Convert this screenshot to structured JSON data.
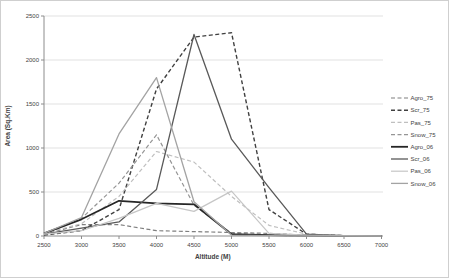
{
  "figure": {
    "kind": "excel-style-line-chart",
    "background": "#ffffff",
    "border_color": "#cfcfcf"
  },
  "chart_data": {
    "type": "line",
    "title": "",
    "xlabel": "Altitude (M)",
    "ylabel": "Area (Sq.Km)",
    "x": [
      2500,
      3000,
      3500,
      4000,
      4500,
      5000,
      5500,
      6000,
      6500,
      7000
    ],
    "xlim": [
      2500,
      7000
    ],
    "ylim": [
      0,
      2500
    ],
    "yticks": [
      0,
      500,
      1000,
      1500,
      2000,
      2500
    ],
    "grid": "horizontal",
    "grid_color": "#d9d9d9",
    "axis_color": "#8c8c8c",
    "text_color": "#3f3f3f",
    "legend_position": "right",
    "series": [
      {
        "name": "Agro_75",
        "style": "dashed",
        "color": "#7f7f7f",
        "width": 1.2,
        "values": [
          20,
          130,
          130,
          60,
          50,
          40,
          30,
          10,
          5,
          0
        ]
      },
      {
        "name": "Scr_75",
        "style": "dashed",
        "color": "#404040",
        "width": 1.4,
        "values": [
          10,
          60,
          300,
          1670,
          2260,
          2310,
          300,
          20,
          5,
          0
        ]
      },
      {
        "name": "Pas_75",
        "style": "dashed",
        "color": "#bfbfbf",
        "width": 1.2,
        "values": [
          30,
          140,
          450,
          960,
          840,
          450,
          120,
          20,
          5,
          0
        ]
      },
      {
        "name": "Snow_75",
        "style": "dashed",
        "color": "#959595",
        "width": 1.2,
        "values": [
          20,
          200,
          600,
          1150,
          350,
          30,
          10,
          0,
          0,
          0
        ]
      },
      {
        "name": "Agro_06",
        "style": "solid",
        "color": "#262626",
        "width": 1.8,
        "values": [
          30,
          190,
          400,
          370,
          360,
          20,
          10,
          5,
          0,
          0
        ]
      },
      {
        "name": "Scr_06",
        "style": "solid",
        "color": "#595959",
        "width": 1.3,
        "values": [
          20,
          90,
          160,
          530,
          2290,
          1100,
          550,
          20,
          5,
          0
        ]
      },
      {
        "name": "Pas_06",
        "style": "solid",
        "color": "#c6c6c6",
        "width": 1.2,
        "values": [
          20,
          60,
          200,
          370,
          280,
          510,
          30,
          10,
          5,
          0
        ]
      },
      {
        "name": "Snow_06",
        "style": "solid",
        "color": "#a3a3a3",
        "width": 1.3,
        "values": [
          30,
          210,
          1160,
          1800,
          390,
          10,
          5,
          0,
          0,
          0
        ]
      }
    ]
  }
}
